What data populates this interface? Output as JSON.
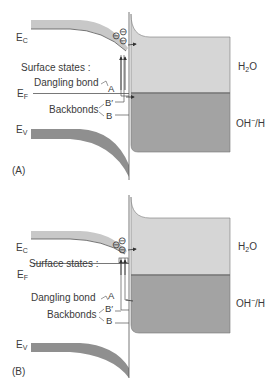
{
  "colors": {
    "conduction_band": "#c8c8c8",
    "valence_band": "#8f8f8f",
    "h2o_region": "#d6d6d6",
    "oh_region": "#a3a3a3",
    "lines": "#555555",
    "text": "#3a3a3a"
  },
  "panels": [
    {
      "id": "A",
      "caption": "(A)",
      "ec_label": {
        "main": "E",
        "sub": "C"
      },
      "ef_label": {
        "main": "E",
        "sub": "F"
      },
      "ev_label": {
        "main": "E",
        "sub": "V"
      },
      "surface_states_label": "Surface states :",
      "dangling_bond_label": "Dangling bond",
      "dangling_bond_marker": "A",
      "backbonds_label": "Backbonds",
      "backbond_markers": [
        "B′",
        "B"
      ],
      "electrolyte_upper": {
        "main": "H",
        "sub": "2",
        "tail": "O"
      },
      "electrolyte_lower": {
        "main": "OH",
        "sup": "−",
        "tail": "/H"
      },
      "electrons": [
        "⊖",
        "⊖",
        "⊖"
      ]
    },
    {
      "id": "B",
      "caption": "(B)",
      "ec_label": {
        "main": "E",
        "sub": "C"
      },
      "ef_label": {
        "main": "E",
        "sub": "F"
      },
      "ev_label": {
        "main": "E",
        "sub": "V"
      },
      "surface_states_label": "Surface states :",
      "dangling_bond_label": "Dangling bond",
      "dangling_bond_marker": "A",
      "backbonds_label": "Backbonds",
      "backbond_markers": [
        "B′",
        "B"
      ],
      "electrolyte_upper": {
        "main": "H",
        "sub": "2",
        "tail": "O"
      },
      "electrolyte_lower": {
        "main": "OH",
        "sup": "−",
        "tail": "/H"
      },
      "electrons": [
        "⊖",
        "⊖",
        "⊖"
      ]
    }
  ]
}
